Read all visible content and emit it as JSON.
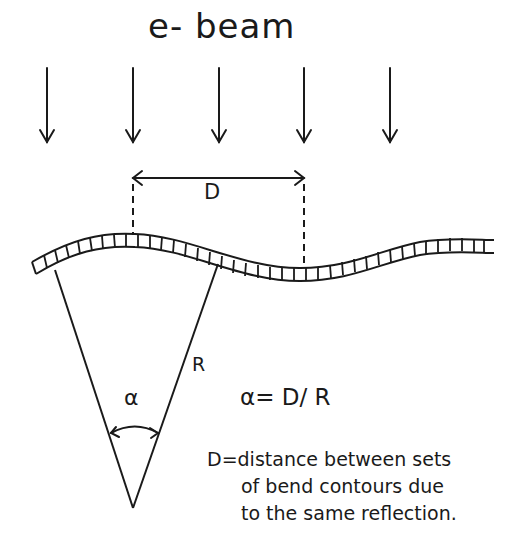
{
  "diagram": {
    "title": "e- beam",
    "beam_arrow_count": 5,
    "distance_label": "D",
    "radius_label": "R",
    "angle_label": "α",
    "equation": "α= D/ R",
    "definition": {
      "line1": "D=distance between sets",
      "line2": "of bend contours due",
      "line3": "to the same reflection."
    }
  }
}
